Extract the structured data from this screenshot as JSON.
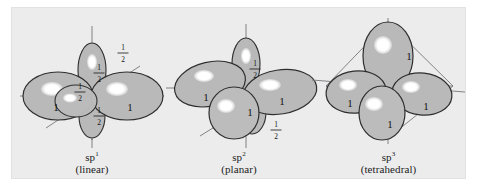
{
  "figure": {
    "kind": "hybrid-orbital-diagram",
    "background_color": "#ffffff",
    "plate_color": "#ececed",
    "lobe_fill": "#b9b9ba",
    "lobe_stroke": "#2e2e2e",
    "highlight_color": "#ffffff",
    "axis_color": "#6f6f70",
    "frame_color": "#6f6f70",
    "label_color": "#141414"
  },
  "panels": [
    {
      "id": "sp1",
      "symbol": "sp",
      "exponent": "1",
      "geometry": "(linear)",
      "hybrid_lobes": [
        {
          "label": "1",
          "direction": "left"
        },
        {
          "label": "1",
          "direction": "right"
        }
      ],
      "residual_lobes": [
        {
          "label_numerator": "1",
          "label_denominator": "2",
          "direction": "up"
        },
        {
          "label_numerator": "1",
          "label_denominator": "2",
          "direction": "down"
        },
        {
          "label_numerator": "1",
          "label_denominator": "2",
          "direction": "up-right"
        },
        {
          "label_numerator": "1",
          "label_denominator": "2",
          "direction": "front-left"
        }
      ]
    },
    {
      "id": "sp2",
      "symbol": "sp",
      "exponent": "2",
      "geometry": "(planar)",
      "hybrid_lobes": [
        {
          "label": "1",
          "direction": "upper-left"
        },
        {
          "label": "1",
          "direction": "right"
        },
        {
          "label": "1",
          "direction": "front-down"
        }
      ],
      "residual_lobes": [
        {
          "label_numerator": "1",
          "label_denominator": "2",
          "direction": "up"
        },
        {
          "label_numerator": "1",
          "label_denominator": "2",
          "direction": "down-right"
        }
      ]
    },
    {
      "id": "sp3",
      "symbol": "sp",
      "exponent": "3",
      "geometry": "(tetrahedral)",
      "hybrid_lobes": [
        {
          "label": "1",
          "direction": "up"
        },
        {
          "label": "1",
          "direction": "left"
        },
        {
          "label": "1",
          "direction": "right"
        },
        {
          "label": "1",
          "direction": "front-down"
        }
      ],
      "residual_lobes": []
    }
  ]
}
